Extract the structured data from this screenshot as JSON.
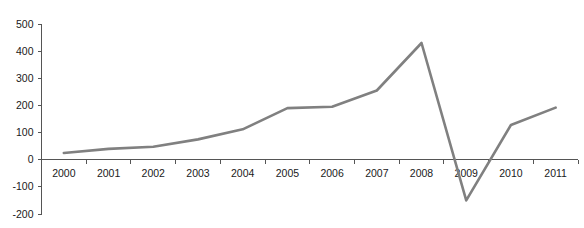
{
  "chart_data": {
    "type": "line",
    "title": "",
    "subtitle": "",
    "xlabel": "",
    "ylabel": "",
    "categories": [
      "2000",
      "2001",
      "2002",
      "2003",
      "2004",
      "2005",
      "2006",
      "2007",
      "2008",
      "2009",
      "2010",
      "2011"
    ],
    "values": [
      25,
      40,
      48,
      75,
      112,
      190,
      195,
      255,
      430,
      -150,
      128,
      192
    ],
    "series": [
      {
        "name": "",
        "values": [
          25,
          40,
          48,
          75,
          112,
          190,
          195,
          255,
          430,
          -150,
          128,
          192
        ]
      }
    ],
    "ylim": [
      -200,
      500
    ],
    "ytick_values": [
      500,
      400,
      300,
      200,
      100,
      0,
      -100,
      -200
    ],
    "ytick_labels": [
      "500",
      "400",
      "300",
      "200",
      "100",
      "0",
      "-100",
      "-200"
    ],
    "xtick_labels": [
      "2000",
      "2001",
      "2002",
      "2003",
      "2004",
      "2005",
      "2006",
      "2007",
      "2008",
      "2009",
      "2010",
      "2011"
    ],
    "grid": false,
    "legend": "none",
    "line_color": "#808080",
    "axis_color": "#555555",
    "text_color": "#1a1a1a",
    "background_color": "#ffffff",
    "line_width": 2.6,
    "annotations": []
  }
}
